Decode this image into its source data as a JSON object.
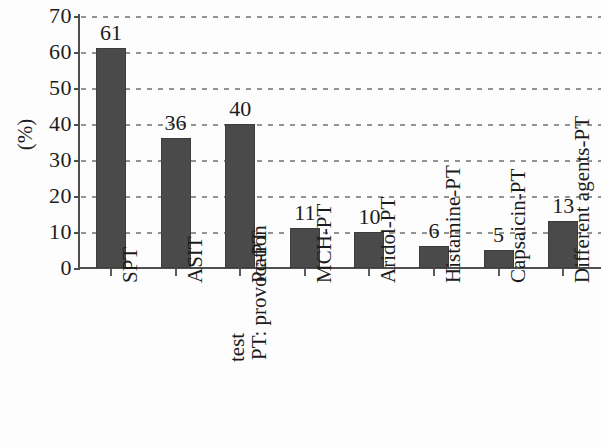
{
  "chart_data": {
    "type": "bar",
    "title": "",
    "subtitle": "",
    "xlabel": "",
    "ylabel": "(%)",
    "ylim": [
      0,
      70
    ],
    "ytick_step": 10,
    "yticks": [
      "70",
      "60",
      "50",
      "40",
      "30",
      "20",
      "10",
      "0"
    ],
    "grid": true,
    "grid_style": "dotted-horizontal",
    "legend": null,
    "legend_position": "none",
    "bar_color": "#4a4a4a",
    "axis_color": "#4f4f4f",
    "categories": [
      "SPT",
      "ASIT",
      "Pc-PT",
      "MCH-PT",
      "Aridol-PT",
      "Histamine-PT",
      "Capsaicin-PT",
      "Different agents-PT"
    ],
    "values": [
      61,
      36,
      40,
      11,
      10,
      6,
      5,
      13
    ],
    "value_labels": [
      "61",
      "36",
      "40",
      "11",
      "10",
      "6",
      "5",
      "13"
    ],
    "annotations": [
      {
        "text": "PT: provocation test",
        "line1": "PT: provocation",
        "line2": "test",
        "attached_to": "Pc-PT"
      }
    ]
  }
}
